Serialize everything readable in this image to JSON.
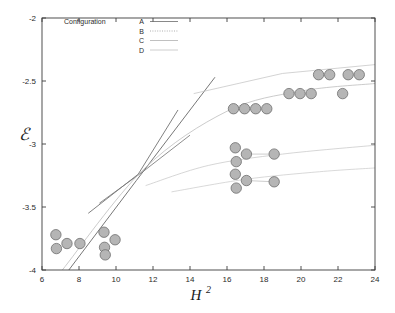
{
  "chart_data": {
    "type": "scatter",
    "title": "",
    "xlabel": "H^2",
    "xlabel_base": "H",
    "xlabel_exponent": "2",
    "ylabel": "E",
    "ylabel_glyph": "ℰ",
    "xlim": [
      6,
      24
    ],
    "ylim": [
      -4,
      -2
    ],
    "xticks": [
      6,
      8,
      10,
      12,
      14,
      16,
      18,
      20,
      22,
      24
    ],
    "xtick_labels": [
      "6",
      "8",
      "10",
      "12",
      "14",
      "16",
      "18",
      "20",
      "22",
      "24"
    ],
    "yticks": [
      -4,
      -3.5,
      -3,
      -2.5,
      -2
    ],
    "ytick_labels": [
      "-4",
      "-3.5",
      "-3",
      "-2.5",
      "-2"
    ],
    "grid": false,
    "legend": {
      "position": "top-left",
      "title": "Configuration",
      "entries": [
        {
          "label": "A",
          "style": "solid",
          "color": "#6b6b6b"
        },
        {
          "label": "B",
          "style": "dotted",
          "color": "#9a9a9a"
        },
        {
          "label": "C",
          "style": "solid-light",
          "color": "#b0b0b0"
        },
        {
          "label": "D",
          "style": "solid-faint",
          "color": "#c2c2c2"
        }
      ]
    },
    "marker": {
      "shape": "circle",
      "fill": "#b5b5b5",
      "edge": "#6e6e6e",
      "radius": 5.2
    },
    "points": [
      {
        "x": 6.75,
        "y": -3.72
      },
      {
        "x": 6.78,
        "y": -3.83
      },
      {
        "x": 7.35,
        "y": -3.79
      },
      {
        "x": 8.05,
        "y": -3.79
      },
      {
        "x": 9.35,
        "y": -3.7
      },
      {
        "x": 9.38,
        "y": -3.82
      },
      {
        "x": 9.95,
        "y": -3.76
      },
      {
        "x": 9.42,
        "y": -3.88
      },
      {
        "x": 16.35,
        "y": -2.72
      },
      {
        "x": 16.95,
        "y": -2.72
      },
      {
        "x": 17.55,
        "y": -2.72
      },
      {
        "x": 18.15,
        "y": -2.72
      },
      {
        "x": 20.95,
        "y": -2.45
      },
      {
        "x": 21.55,
        "y": -2.45
      },
      {
        "x": 22.55,
        "y": -2.45
      },
      {
        "x": 23.15,
        "y": -2.45
      },
      {
        "x": 19.35,
        "y": -2.6
      },
      {
        "x": 19.95,
        "y": -2.6
      },
      {
        "x": 20.55,
        "y": -2.6
      },
      {
        "x": 22.25,
        "y": -2.6
      },
      {
        "x": 16.45,
        "y": -3.03
      },
      {
        "x": 16.5,
        "y": -3.14
      },
      {
        "x": 17.05,
        "y": -3.08
      },
      {
        "x": 18.55,
        "y": -3.08
      },
      {
        "x": 16.45,
        "y": -3.24
      },
      {
        "x": 16.5,
        "y": -3.35
      },
      {
        "x": 17.05,
        "y": -3.29
      },
      {
        "x": 18.55,
        "y": -3.3
      }
    ],
    "series": [
      {
        "name": "Configuration A",
        "type": "line",
        "style": "solid",
        "color": "#5e5e5e",
        "points": [
          [
            7.45,
            -4.0
          ],
          [
            11.1,
            -3.29
          ],
          [
            15.35,
            -2.47
          ]
        ]
      },
      {
        "name": "Configuration A-steep",
        "type": "line",
        "style": "solid",
        "color": "#6a6a6a",
        "points": [
          [
            8.5,
            -3.55
          ],
          [
            11.2,
            -3.24
          ],
          [
            13.35,
            -2.73
          ]
        ]
      },
      {
        "name": "Configuration B",
        "type": "line",
        "style": "solid",
        "color": "#7a7a7a",
        "points": [
          [
            9.1,
            -3.47
          ],
          [
            11.45,
            -3.22
          ],
          [
            14.0,
            -2.93
          ]
        ]
      },
      {
        "name": "Configuration C",
        "type": "curve",
        "style": "light",
        "color": "#b4b4b4",
        "points": [
          [
            7.1,
            -4.0
          ],
          [
            11.5,
            -3.2
          ],
          [
            16.0,
            -2.74
          ],
          [
            20.0,
            -2.58
          ],
          [
            24.0,
            -2.52
          ]
        ]
      },
      {
        "name": "Configuration D",
        "type": "curve",
        "style": "faint",
        "color": "#c4c4c4",
        "points": [
          [
            11.6,
            -3.33
          ],
          [
            15.0,
            -3.17
          ],
          [
            19.0,
            -3.08
          ],
          [
            24.0,
            -3.01
          ]
        ]
      },
      {
        "name": "Configuration D-lower",
        "type": "curve",
        "style": "faint",
        "color": "#c8c8c8",
        "points": [
          [
            13.0,
            -3.38
          ],
          [
            17.0,
            -3.28
          ],
          [
            21.0,
            -3.22
          ],
          [
            24.0,
            -3.19
          ]
        ]
      },
      {
        "name": "Configuration C-upper",
        "type": "line",
        "style": "faint",
        "color": "#c0c0c0",
        "points": [
          [
            14.2,
            -2.6
          ],
          [
            19.0,
            -2.44
          ],
          [
            24.0,
            -2.37
          ]
        ]
      }
    ],
    "connectors": [
      {
        "from": [
          17.05,
          -3.08
        ],
        "to": [
          18.55,
          -3.08
        ]
      },
      {
        "from": [
          17.05,
          -3.29
        ],
        "to": [
          18.55,
          -3.3
        ]
      }
    ]
  },
  "axes": {
    "frame_color": "#3c3c3c",
    "tick_color": "#3c3c3c"
  }
}
